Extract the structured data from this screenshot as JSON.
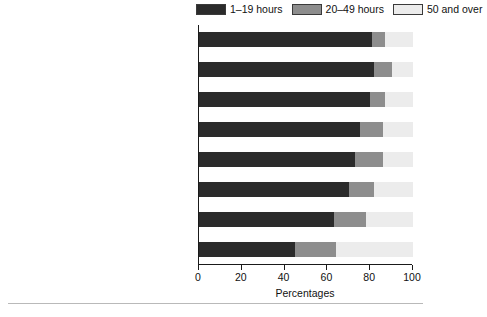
{
  "chart_data": {
    "type": "bar",
    "orientation": "horizontal",
    "stacked": true,
    "title": "",
    "xlabel": "Percentages",
    "ylabel": "",
    "xlim": [
      0,
      100
    ],
    "xticks": [
      0,
      20,
      40,
      60,
      80,
      100
    ],
    "grid": false,
    "legend_position": "top-right",
    "categories": [
      "Higher managerial and professional",
      "Lower managerial and professional",
      "Intermediate",
      "Small employers/own account workers",
      "Lower supervisory and technical",
      "Semi-routine",
      "Routine",
      "Never worked and long-term employed"
    ],
    "series": [
      {
        "name": "1–19 hours",
        "color": "#2b2b2b",
        "values": [
          81,
          82,
          80,
          75,
          73,
          70,
          63,
          45
        ]
      },
      {
        "name": "20–49 hours",
        "color": "#8d8d8d",
        "values": [
          6,
          8,
          7,
          11,
          13,
          12,
          15,
          19
        ]
      },
      {
        "name": "50 and over",
        "color": "#ececec",
        "values": [
          13,
          10,
          13,
          14,
          14,
          18,
          22,
          36
        ]
      }
    ]
  },
  "legend": {
    "items": [
      {
        "label": "1–19 hours"
      },
      {
        "label": "20–49 hours"
      },
      {
        "label": "50 and over"
      }
    ]
  },
  "axis": {
    "x_title": "Percentages",
    "tick_labels": [
      "0",
      "20",
      "40",
      "60",
      "80",
      "100"
    ]
  },
  "caption": {
    "text": ""
  }
}
